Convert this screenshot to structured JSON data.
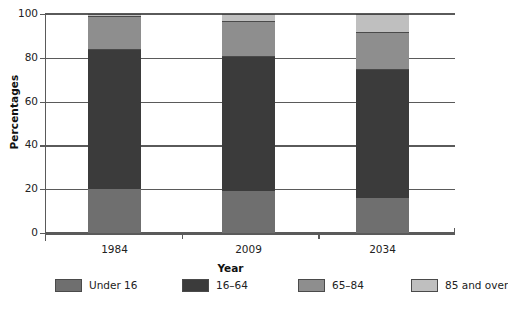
{
  "chart_data": {
    "type": "bar",
    "subtype": "stacked-vertical-100",
    "title": "",
    "xlabel": "Year",
    "ylabel": "Percentages",
    "categories": [
      "1984",
      "2009",
      "2034"
    ],
    "series": [
      {
        "name": "Under 16",
        "color": "#6f6f6f",
        "values": [
          20,
          19,
          16
        ]
      },
      {
        "name": "16–64",
        "color": "#3b3b3b",
        "values": [
          64,
          62,
          59
        ]
      },
      {
        "name": "65–84",
        "color": "#8e8e8e",
        "values": [
          15,
          16,
          17
        ]
      },
      {
        "name": "85 and over",
        "color": "#bfbfbf",
        "values": [
          1,
          3,
          8
        ]
      }
    ],
    "ylim": [
      0,
      100
    ],
    "yticks": [
      0,
      20,
      40,
      60,
      80,
      100
    ],
    "ytick_labels": [
      "0",
      "20",
      "40",
      "60",
      "80",
      "100"
    ],
    "grid": true,
    "grid_axis": "y",
    "legend_position": "bottom"
  },
  "axes": {
    "y_title": "Percentages",
    "x_title": "Year",
    "y_ticks": [
      {
        "label": "100",
        "value": 100
      },
      {
        "label": "80",
        "value": 80
      },
      {
        "label": "60",
        "value": 60
      },
      {
        "label": "40",
        "value": 40
      },
      {
        "label": "20",
        "value": 20
      },
      {
        "label": "0",
        "value": 0
      }
    ],
    "x_categories": [
      {
        "label": "1984"
      },
      {
        "label": "2009"
      },
      {
        "label": "2034"
      }
    ]
  },
  "legend": {
    "items": [
      {
        "label": "Under 16",
        "color": "#6f6f6f"
      },
      {
        "label": "16–64",
        "color": "#3b3b3b"
      },
      {
        "label": "65–84",
        "color": "#8e8e8e"
      },
      {
        "label": "85 and over",
        "color": "#bfbfbf"
      }
    ]
  }
}
